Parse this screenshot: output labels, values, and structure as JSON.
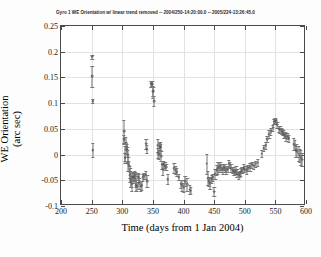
{
  "figure": {
    "title": "Gyro 1 WE Orientation w/ linear trend removed -- 2004/250-14:20:00.0 -- 2005/224-13:26:45.0",
    "xlabel": "Time (days from 1 Jan 2004)",
    "ylabel_line1": "WE Orientation",
    "ylabel_line2": "(arc sec)"
  },
  "chart_data": {
    "type": "scatter",
    "title": "Gyro 1 WE Orientation w/ linear trend removed -- 2004/250-14:20:00.0 -- 2005/224-13:26:45.0",
    "xlabel": "Time (days from 1 Jan 2004)",
    "ylabel": "WE Orientation (arc sec)",
    "xlim": [
      200,
      600
    ],
    "ylim": [
      -0.1,
      0.25
    ],
    "xticks": [
      200,
      250,
      300,
      350,
      400,
      450,
      500,
      550,
      600
    ],
    "xticklabels": [
      "200",
      "250",
      "300",
      "350",
      "400",
      "450",
      "500",
      "550",
      "600"
    ],
    "yticks": [
      -0.1,
      -0.05,
      0,
      0.05,
      0.1,
      0.15,
      0.2,
      0.25
    ],
    "yticklabels": [
      "-0.1",
      "-0.05",
      "0",
      "0.05",
      "0.1",
      "0.15",
      "0.2",
      "0.25"
    ],
    "grid": true,
    "legend": null,
    "marker": "open-circle",
    "errorbars": true,
    "series": [
      {
        "name": "Gyro 1 WE Orientation",
        "points": [
          {
            "x": 251,
            "y": 0.19,
            "err": 0.004
          },
          {
            "x": 251,
            "y": 0.152,
            "err": 0.02
          },
          {
            "x": 252,
            "y": 0.104,
            "err": 0.004
          },
          {
            "x": 252,
            "y": 0.009,
            "err": 0.014
          },
          {
            "x": 303,
            "y": 0.045,
            "err": 0.022
          },
          {
            "x": 303,
            "y": 0.03,
            "err": 0.009
          },
          {
            "x": 305,
            "y": 0.002,
            "err": 0.014
          },
          {
            "x": 305,
            "y": -0.006,
            "err": 0.01
          },
          {
            "x": 306,
            "y": 0.022,
            "err": 0.012
          },
          {
            "x": 307,
            "y": 0.012,
            "err": 0.009
          },
          {
            "x": 307,
            "y": 0.014,
            "err": 0.006
          },
          {
            "x": 308,
            "y": 0.008,
            "err": 0.007
          },
          {
            "x": 309,
            "y": -0.003,
            "err": 0.012
          },
          {
            "x": 310,
            "y": -0.018,
            "err": 0.014
          },
          {
            "x": 311,
            "y": -0.022,
            "err": 0.01
          },
          {
            "x": 312,
            "y": -0.034,
            "err": 0.012
          },
          {
            "x": 313,
            "y": -0.04,
            "err": 0.013
          },
          {
            "x": 314,
            "y": -0.048,
            "err": 0.016
          },
          {
            "x": 315,
            "y": -0.052,
            "err": 0.011
          },
          {
            "x": 316,
            "y": -0.057,
            "err": 0.014
          },
          {
            "x": 317,
            "y": -0.043,
            "err": 0.009
          },
          {
            "x": 318,
            "y": -0.044,
            "err": 0.008
          },
          {
            "x": 319,
            "y": -0.046,
            "err": 0.01
          },
          {
            "x": 320,
            "y": -0.038,
            "err": 0.007
          },
          {
            "x": 321,
            "y": -0.042,
            "err": 0.008
          },
          {
            "x": 322,
            "y": -0.05,
            "err": 0.013
          },
          {
            "x": 323,
            "y": -0.06,
            "err": 0.011
          },
          {
            "x": 324,
            "y": -0.062,
            "err": 0.009
          },
          {
            "x": 326,
            "y": -0.043,
            "err": 0.007
          },
          {
            "x": 327,
            "y": -0.045,
            "err": 0.008
          },
          {
            "x": 328,
            "y": -0.056,
            "err": 0.01
          },
          {
            "x": 330,
            "y": -0.061,
            "err": 0.009
          },
          {
            "x": 332,
            "y": -0.06,
            "err": 0.008
          },
          {
            "x": 334,
            "y": -0.044,
            "err": 0.007
          },
          {
            "x": 336,
            "y": -0.041,
            "err": 0.006
          },
          {
            "x": 338,
            "y": -0.039,
            "err": 0.008
          },
          {
            "x": 339,
            "y": 0.021,
            "err": 0.01
          },
          {
            "x": 340,
            "y": 0.011,
            "err": 0.008
          },
          {
            "x": 341,
            "y": -0.052,
            "err": 0.012
          },
          {
            "x": 347,
            "y": 0.138,
            "err": 0.006
          },
          {
            "x": 348,
            "y": 0.139,
            "err": 0.005
          },
          {
            "x": 349,
            "y": 0.137,
            "err": 0.006
          },
          {
            "x": 350,
            "y": 0.122,
            "err": 0.012
          },
          {
            "x": 351,
            "y": 0.123,
            "err": 0.009
          },
          {
            "x": 352,
            "y": 0.104,
            "err": 0.01
          },
          {
            "x": 358,
            "y": 0.018,
            "err": 0.013
          },
          {
            "x": 359,
            "y": 0.003,
            "err": 0.01
          },
          {
            "x": 360,
            "y": 0.0,
            "err": 0.009
          },
          {
            "x": 361,
            "y": 0.013,
            "err": 0.01
          },
          {
            "x": 362,
            "y": 0.016,
            "err": 0.008
          },
          {
            "x": 363,
            "y": 0.014,
            "err": 0.007
          },
          {
            "x": 364,
            "y": -0.003,
            "err": 0.009
          },
          {
            "x": 365,
            "y": -0.02,
            "err": 0.008
          },
          {
            "x": 366,
            "y": -0.028,
            "err": 0.011
          },
          {
            "x": 368,
            "y": -0.019,
            "err": 0.007
          },
          {
            "x": 370,
            "y": -0.022,
            "err": 0.008
          },
          {
            "x": 372,
            "y": -0.024,
            "err": 0.006
          },
          {
            "x": 374,
            "y": -0.048,
            "err": 0.01
          },
          {
            "x": 385,
            "y": -0.026,
            "err": 0.009
          },
          {
            "x": 387,
            "y": -0.03,
            "err": 0.007
          },
          {
            "x": 389,
            "y": -0.034,
            "err": 0.008
          },
          {
            "x": 392,
            "y": -0.044,
            "err": 0.006
          },
          {
            "x": 396,
            "y": -0.057,
            "err": 0.008
          },
          {
            "x": 398,
            "y": -0.06,
            "err": 0.01
          },
          {
            "x": 400,
            "y": -0.064,
            "err": 0.009
          },
          {
            "x": 403,
            "y": -0.052,
            "err": 0.01
          },
          {
            "x": 406,
            "y": -0.058,
            "err": 0.012
          },
          {
            "x": 410,
            "y": -0.068,
            "err": 0.009
          },
          {
            "x": 412,
            "y": -0.07,
            "err": 0.007
          },
          {
            "x": 438,
            "y": -0.018,
            "err": 0.02
          },
          {
            "x": 440,
            "y": -0.046,
            "err": 0.014
          },
          {
            "x": 442,
            "y": -0.052,
            "err": 0.009
          },
          {
            "x": 444,
            "y": -0.056,
            "err": 0.01
          },
          {
            "x": 446,
            "y": -0.048,
            "err": 0.008
          },
          {
            "x": 448,
            "y": -0.044,
            "err": 0.007
          },
          {
            "x": 450,
            "y": -0.072,
            "err": 0.008
          },
          {
            "x": 452,
            "y": -0.038,
            "err": 0.01
          },
          {
            "x": 454,
            "y": -0.03,
            "err": 0.009
          },
          {
            "x": 456,
            "y": -0.026,
            "err": 0.012
          },
          {
            "x": 458,
            "y": -0.024,
            "err": 0.01
          },
          {
            "x": 460,
            "y": -0.022,
            "err": 0.008
          },
          {
            "x": 462,
            "y": -0.026,
            "err": 0.007
          },
          {
            "x": 464,
            "y": -0.028,
            "err": 0.009
          },
          {
            "x": 466,
            "y": -0.024,
            "err": 0.006
          },
          {
            "x": 468,
            "y": -0.026,
            "err": 0.007
          },
          {
            "x": 470,
            "y": -0.03,
            "err": 0.008
          },
          {
            "x": 472,
            "y": -0.028,
            "err": 0.006
          },
          {
            "x": 474,
            "y": -0.018,
            "err": 0.007
          },
          {
            "x": 476,
            "y": -0.02,
            "err": 0.006
          },
          {
            "x": 478,
            "y": -0.026,
            "err": 0.007
          },
          {
            "x": 480,
            "y": -0.03,
            "err": 0.006
          },
          {
            "x": 482,
            "y": -0.032,
            "err": 0.007
          },
          {
            "x": 484,
            "y": -0.034,
            "err": 0.006
          },
          {
            "x": 486,
            "y": -0.03,
            "err": 0.007
          },
          {
            "x": 488,
            "y": -0.036,
            "err": 0.008
          },
          {
            "x": 490,
            "y": -0.04,
            "err": 0.007
          },
          {
            "x": 492,
            "y": -0.038,
            "err": 0.006
          },
          {
            "x": 494,
            "y": -0.034,
            "err": 0.007
          },
          {
            "x": 496,
            "y": -0.03,
            "err": 0.006
          },
          {
            "x": 498,
            "y": -0.026,
            "err": 0.007
          },
          {
            "x": 500,
            "y": -0.028,
            "err": 0.006
          },
          {
            "x": 503,
            "y": -0.03,
            "err": 0.007
          },
          {
            "x": 506,
            "y": -0.026,
            "err": 0.006
          },
          {
            "x": 509,
            "y": -0.024,
            "err": 0.007
          },
          {
            "x": 512,
            "y": -0.02,
            "err": 0.006
          },
          {
            "x": 515,
            "y": -0.022,
            "err": 0.007
          },
          {
            "x": 518,
            "y": -0.018,
            "err": 0.006
          },
          {
            "x": 521,
            "y": -0.016,
            "err": 0.007
          },
          {
            "x": 528,
            "y": 0.002,
            "err": 0.007
          },
          {
            "x": 531,
            "y": 0.012,
            "err": 0.006
          },
          {
            "x": 534,
            "y": 0.018,
            "err": 0.007
          },
          {
            "x": 537,
            "y": 0.03,
            "err": 0.006
          },
          {
            "x": 540,
            "y": 0.04,
            "err": 0.007
          },
          {
            "x": 543,
            "y": 0.045,
            "err": 0.006
          },
          {
            "x": 546,
            "y": 0.052,
            "err": 0.006
          },
          {
            "x": 548,
            "y": 0.064,
            "err": 0.005
          },
          {
            "x": 550,
            "y": 0.066,
            "err": 0.005
          },
          {
            "x": 551,
            "y": 0.065,
            "err": 0.005
          },
          {
            "x": 553,
            "y": 0.058,
            "err": 0.006
          },
          {
            "x": 556,
            "y": 0.05,
            "err": 0.006
          },
          {
            "x": 558,
            "y": 0.048,
            "err": 0.007
          },
          {
            "x": 560,
            "y": 0.046,
            "err": 0.006
          },
          {
            "x": 562,
            "y": 0.044,
            "err": 0.006
          },
          {
            "x": 564,
            "y": 0.04,
            "err": 0.007
          },
          {
            "x": 566,
            "y": 0.038,
            "err": 0.006
          },
          {
            "x": 568,
            "y": 0.034,
            "err": 0.007
          },
          {
            "x": 570,
            "y": 0.036,
            "err": 0.006
          },
          {
            "x": 572,
            "y": 0.032,
            "err": 0.007
          },
          {
            "x": 580,
            "y": 0.02,
            "err": 0.012
          },
          {
            "x": 582,
            "y": 0.018,
            "err": 0.01
          },
          {
            "x": 584,
            "y": 0.008,
            "err": 0.013
          },
          {
            "x": 586,
            "y": 0.006,
            "err": 0.011
          },
          {
            "x": 588,
            "y": 0.002,
            "err": 0.014
          },
          {
            "x": 590,
            "y": -0.002,
            "err": 0.012
          },
          {
            "x": 592,
            "y": -0.006,
            "err": 0.015
          },
          {
            "x": 594,
            "y": -0.01,
            "err": 0.013
          }
        ]
      }
    ]
  }
}
